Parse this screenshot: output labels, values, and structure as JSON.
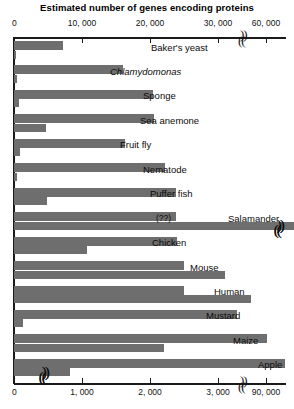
{
  "chart_data": {
    "type": "bar",
    "title": "Estimated number of genes encoding proteins",
    "orientation": "horizontal",
    "grid": false,
    "legend": null,
    "axes": {
      "top": {
        "name": "genes",
        "label": "Estimated number of genes encoding proteins",
        "ticks": [
          "0",
          "10,000",
          "20,000",
          "30,000",
          "60,000"
        ],
        "tick_values": [
          0,
          10000,
          20000,
          30000,
          60000
        ],
        "has_break": true,
        "break_between": [
          30000,
          60000
        ]
      },
      "bottom": {
        "name": "genome-size",
        "label": "",
        "ticks": [
          "0",
          "1,000",
          "2,000",
          "3,000",
          "90,000"
        ],
        "tick_values": [
          0,
          1000,
          2000,
          3000,
          90000
        ],
        "has_break": true,
        "break_between": [
          3000,
          90000
        ]
      }
    },
    "categories": [
      "Baker's yeast",
      "Chlamydomonas",
      "Sponge",
      "Sea anemone",
      "Fruit fly",
      "Nematode",
      "Puffer fish",
      "Salamander",
      "Chicken",
      "Mouse",
      "Human",
      "Mustard",
      "Maize",
      "Apple"
    ],
    "series": [
      {
        "name": "genes",
        "axis": "top",
        "values": [
          6000,
          15000,
          18000,
          18000,
          14000,
          19000,
          21000,
          null,
          21000,
          23000,
          21000,
          27000,
          30000,
          31000
        ]
      },
      {
        "name": "genome-size",
        "axis": "bottom",
        "values": [
          12,
          120,
          170,
          450,
          180,
          100,
          390,
          90000,
          1050,
          2700,
          3100,
          135,
          2000,
          740
        ]
      }
    ],
    "annotations": [
      {
        "text": "(??)",
        "category": "Salamander",
        "series": "genes"
      },
      {
        "text": "Salamander",
        "category": "Salamander",
        "note": "label sits above the broken genome bar"
      }
    ]
  },
  "rows": [
    {
      "label": "Baker's yeast",
      "italic": false,
      "genes_w": 130,
      "genome_w": 4,
      "label_x": 151,
      "break": false
    },
    {
      "label": "Chlamydomonas",
      "italic": true,
      "genes_w": 290,
      "genome_w": 9,
      "label_x": 110,
      "break": false
    },
    {
      "label": "Sponge",
      "italic": false,
      "genes_w": 368,
      "genome_w": 14,
      "label_x": 143,
      "break": false
    },
    {
      "label": "Sea anemone",
      "italic": false,
      "genes_w": 370,
      "genome_w": 84,
      "label_x": 140,
      "break": false
    },
    {
      "label": "Fruit fly",
      "italic": false,
      "genes_w": 293,
      "genome_w": 16,
      "label_x": 120,
      "break": false
    },
    {
      "label": "Nematode",
      "italic": false,
      "genes_w": 400,
      "genome_w": 8,
      "label_x": 143,
      "break": false
    },
    {
      "label": "Puffer fish",
      "italic": false,
      "genes_w": 430,
      "genome_w": 88,
      "label_x": 150,
      "break": false
    },
    {
      "label": "Salamander",
      "italic": false,
      "genes_w": 428,
      "genome_w": 770,
      "label_x": 228,
      "break": true,
      "sublabel": "(??)",
      "sublabel_x": 156
    },
    {
      "label": "Chicken",
      "italic": false,
      "genes_w": 432,
      "genome_w": 194,
      "label_x": 152,
      "break": false
    },
    {
      "label": "Mouse",
      "italic": false,
      "genes_w": 450,
      "genome_w": 558,
      "label_x": 190,
      "break": false
    },
    {
      "label": "Human",
      "italic": false,
      "genes_w": 450,
      "genome_w": 628,
      "label_x": 214,
      "break": false
    },
    {
      "label": "Mustard",
      "italic": false,
      "genes_w": 592,
      "genome_w": 24,
      "label_x": 206,
      "break": false
    },
    {
      "label": "Maize",
      "italic": false,
      "genes_w": 670,
      "genome_w": 398,
      "label_x": 233,
      "break": false
    },
    {
      "label": "Apple",
      "italic": false,
      "genes_w": 718,
      "genome_w": 148,
      "label_x": 258,
      "break": true
    }
  ],
  "axis_top": {
    "ticks": [
      {
        "text": "0",
        "x": 14
      },
      {
        "text": "10, 000",
        "x": 82
      },
      {
        "text": "20, 000",
        "x": 150
      },
      {
        "text": "30, 000",
        "x": 218
      },
      {
        "text": "60, 000",
        "x": 266
      }
    ],
    "break_x": 240
  },
  "axis_bottom": {
    "ticks": [
      {
        "text": "0",
        "x": 14
      },
      {
        "text": "1, 000",
        "x": 82
      },
      {
        "text": "2, 000",
        "x": 150
      },
      {
        "text": "3, 000",
        "x": 218
      },
      {
        "text": "90, 000",
        "x": 266
      }
    ],
    "break_x": 240
  },
  "colors": {
    "bar": "#6e6e6e",
    "axis": "#1a1a1a",
    "text": "#0b0b0b",
    "background": "#ffffff"
  }
}
